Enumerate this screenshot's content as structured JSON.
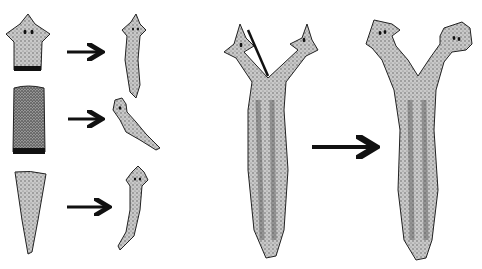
{
  "figure": {
    "left_panel": {
      "rows": [
        {
          "fragment": "head-piece",
          "result": "regenerated-worm"
        },
        {
          "fragment": "middle-piece",
          "result": "regenerated-worm"
        },
        {
          "fragment": "tail-piece",
          "result": "regenerated-worm"
        }
      ]
    },
    "right_panel": {
      "before": "split-head-worm",
      "after": "two-headed-worm"
    },
    "signature": "",
    "colors": {
      "background": "#ffffff",
      "outline": "#1a1a1a",
      "stipple_fill": "#bdbdbd",
      "dark_stipple": "#6e6e6e",
      "arrow": "#111111"
    }
  }
}
